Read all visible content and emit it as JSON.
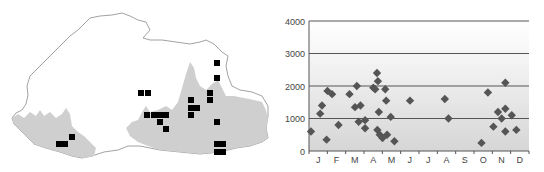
{
  "map": {
    "outline_color": "#8a8a8a",
    "shade_color": "#cfcfcf",
    "marker_color": "#000000",
    "markers": [
      [
        59,
        144
      ],
      [
        65,
        144
      ],
      [
        72,
        137
      ],
      [
        141,
        93
      ],
      [
        148,
        93
      ],
      [
        147,
        115
      ],
      [
        154,
        115
      ],
      [
        160,
        115
      ],
      [
        166,
        115
      ],
      [
        160,
        122
      ],
      [
        166,
        129
      ],
      [
        191,
        100
      ],
      [
        191,
        108
      ],
      [
        197,
        108
      ],
      [
        191,
        115
      ],
      [
        210,
        93
      ],
      [
        210,
        100
      ],
      [
        217,
        63
      ],
      [
        217,
        78
      ],
      [
        217,
        122
      ],
      [
        217,
        144
      ],
      [
        223,
        144
      ],
      [
        217,
        152
      ],
      [
        223,
        152
      ]
    ]
  },
  "chart_data": {
    "type": "scatter",
    "title": "",
    "xlabel": "",
    "ylabel": "",
    "ylim": [
      0,
      4000
    ],
    "yticks": [
      0,
      1000,
      2000,
      3000,
      4000
    ],
    "ytick_labels": [
      "0",
      "1000",
      "2000",
      "3000",
      "4000"
    ],
    "categories": [
      "J",
      "F",
      "M",
      "A",
      "M",
      "J",
      "J",
      "A",
      "S",
      "O",
      "N",
      "D"
    ],
    "grid": true,
    "marker": "diamond",
    "marker_color": "#555555",
    "points": [
      {
        "month": 0.0,
        "value": 600
      },
      {
        "month": 0.5,
        "value": 1150
      },
      {
        "month": 0.6,
        "value": 1400
      },
      {
        "month": 0.9,
        "value": 1850
      },
      {
        "month": 0.85,
        "value": 350
      },
      {
        "month": 1.15,
        "value": 1750
      },
      {
        "month": 1.5,
        "value": 800
      },
      {
        "month": 2.1,
        "value": 1750
      },
      {
        "month": 2.5,
        "value": 2000
      },
      {
        "month": 2.4,
        "value": 1350
      },
      {
        "month": 2.7,
        "value": 1400
      },
      {
        "month": 2.6,
        "value": 900
      },
      {
        "month": 2.95,
        "value": 950
      },
      {
        "month": 2.95,
        "value": 700
      },
      {
        "month": 3.4,
        "value": 1950
      },
      {
        "month": 3.5,
        "value": 1900
      },
      {
        "month": 3.6,
        "value": 2400
      },
      {
        "month": 3.65,
        "value": 2150
      },
      {
        "month": 3.7,
        "value": 1200
      },
      {
        "month": 3.62,
        "value": 650
      },
      {
        "month": 3.75,
        "value": 500
      },
      {
        "month": 3.9,
        "value": 400
      },
      {
        "month": 4.15,
        "value": 500
      },
      {
        "month": 4.05,
        "value": 1900
      },
      {
        "month": 4.1,
        "value": 1550
      },
      {
        "month": 4.35,
        "value": 1050
      },
      {
        "month": 4.55,
        "value": 300
      },
      {
        "month": 5.4,
        "value": 1550
      },
      {
        "month": 7.3,
        "value": 1600
      },
      {
        "month": 7.5,
        "value": 1000
      },
      {
        "month": 9.3,
        "value": 250
      },
      {
        "month": 9.65,
        "value": 1800
      },
      {
        "month": 9.95,
        "value": 750
      },
      {
        "month": 10.2,
        "value": 1200
      },
      {
        "month": 10.4,
        "value": 1000
      },
      {
        "month": 10.6,
        "value": 2100
      },
      {
        "month": 10.6,
        "value": 1300
      },
      {
        "month": 10.6,
        "value": 600
      },
      {
        "month": 10.95,
        "value": 1100
      },
      {
        "month": 11.2,
        "value": 650
      }
    ]
  }
}
